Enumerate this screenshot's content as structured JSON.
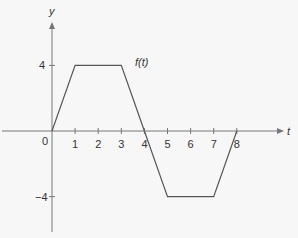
{
  "chart_data": {
    "type": "line",
    "title": "",
    "xlabel": "t",
    "ylabel": "y",
    "curve_label": "f(t)",
    "x": [
      0,
      1,
      3,
      4,
      5,
      7,
      8
    ],
    "series": [
      {
        "name": "f(t)",
        "values": [
          0,
          4,
          4,
          0,
          -4,
          -4,
          0
        ]
      }
    ],
    "x_ticks": [
      "0",
      "1",
      "2",
      "3",
      "4",
      "5",
      "6",
      "7",
      "8"
    ],
    "y_ticks": [
      "4",
      "-4"
    ],
    "xlim": [
      0,
      10
    ],
    "ylim": [
      -6,
      6.5
    ],
    "grid": false,
    "legend": "none"
  },
  "colors": {
    "line": "#555555",
    "axis": "#777777",
    "text": "#333333"
  }
}
